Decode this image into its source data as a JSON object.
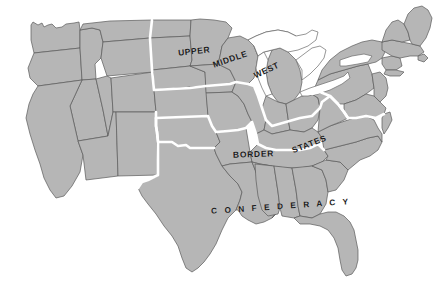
{
  "map": {
    "title": "United States Civil War Regions Map",
    "background_color": "#ffffff",
    "land_fill_color": "#b6b6b6",
    "state_border_color": "#5a5a5a",
    "region_divider_color": "#ffffff",
    "lake_fill_color": "#ffffff",
    "label_color": "#1c1c1c",
    "regions": [
      {
        "id": "upper-middle-west",
        "name": "Upper Middle West",
        "label_words": [
          "UPPER",
          "MIDDLE",
          "WEST"
        ]
      },
      {
        "id": "border-states",
        "name": "Border States",
        "label_words": [
          "BORDER",
          "STATES"
        ]
      },
      {
        "id": "confederacy",
        "name": "Confederacy",
        "label_words": [
          "C O N F E D E R A C Y"
        ]
      }
    ],
    "labels": {
      "upper": "UPPER",
      "middle": "MIDDLE",
      "west": "WEST",
      "border": "BORDER",
      "states": "STATES",
      "confederacy": "C O N F E D E R A C Y"
    }
  }
}
